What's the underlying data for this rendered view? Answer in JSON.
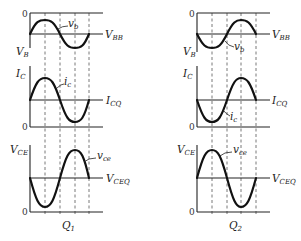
{
  "diagram": {
    "zero_label": "0",
    "panels": [
      {
        "id": "Q1",
        "caption": {
          "main": "Q",
          "sub": "1"
        },
        "rows": [
          {
            "axis": {
              "main": "V",
              "sub": "B"
            },
            "baseline": {
              "main": "V",
              "sub": "BB"
            },
            "wave": {
              "main": "v",
              "sub": "b"
            },
            "phase": "positive-first"
          },
          {
            "axis": {
              "main": "I",
              "sub": "C"
            },
            "baseline": {
              "main": "I",
              "sub": "CQ"
            },
            "wave": {
              "main": "i",
              "sub": "c"
            },
            "phase": "positive-first"
          },
          {
            "axis": {
              "main": "V",
              "sub": "CE"
            },
            "baseline": {
              "main": "V",
              "sub": "CEQ"
            },
            "wave": {
              "main": "v",
              "sub": "ce"
            },
            "phase": "negative-first"
          }
        ]
      },
      {
        "id": "Q2",
        "caption": {
          "main": "Q",
          "sub": "2"
        },
        "rows": [
          {
            "axis": {
              "main": "V",
              "sub": "B"
            },
            "baseline": {
              "main": "V",
              "sub": "BB"
            },
            "wave": {
              "main": "v",
              "sub": "b"
            },
            "phase": "negative-first"
          },
          {
            "axis": {
              "main": "I",
              "sub": "C"
            },
            "baseline": {
              "main": "I",
              "sub": "CQ"
            },
            "wave": {
              "main": "i",
              "sub": "c"
            },
            "phase": "negative-first"
          },
          {
            "axis": {
              "main": "V",
              "sub": "CE"
            },
            "baseline": {
              "main": "V",
              "sub": "CEQ"
            },
            "wave": {
              "main": "v",
              "sub": "ce"
            },
            "phase": "positive-first"
          }
        ]
      }
    ]
  }
}
